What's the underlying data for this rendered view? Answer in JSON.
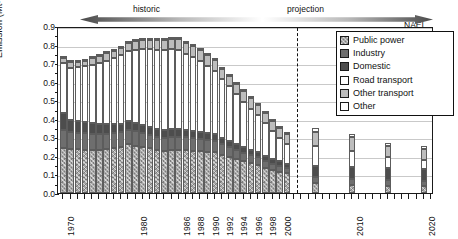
{
  "chart_data": {
    "type": "bar",
    "subtype": "stacked-bar",
    "title": "",
    "xlabel": "",
    "ylabel": "Emission (Mt-N)",
    "ylim": [
      0.0,
      0.9
    ],
    "yticks": [
      "0.0",
      "0.1",
      "0.2",
      "0.3",
      "0.4",
      "0.5",
      "0.6",
      "0.7",
      "0.8",
      "0.9"
    ],
    "grid": "horizontal",
    "legend_position": "top-right",
    "series_order": [
      "Public power",
      "Industry",
      "Domestic",
      "Road transport",
      "Other transport",
      "Other"
    ],
    "series": [
      {
        "name": "Public power",
        "values": [
          0.24,
          0.238,
          0.236,
          0.234,
          0.232,
          0.234,
          0.238,
          0.242,
          0.248,
          0.262,
          0.255,
          0.248,
          0.24,
          0.232,
          0.228,
          0.23,
          0.232,
          0.23,
          0.228,
          0.224,
          0.222,
          0.22,
          0.205,
          0.196,
          0.183,
          0.17,
          0.16,
          0.152,
          0.137,
          0.124,
          0.115,
          0.106,
          0.052,
          0.045,
          0.04,
          0.038
        ]
      },
      {
        "name": "Industry",
        "values": [
          0.098,
          0.092,
          0.09,
          0.088,
          0.086,
          0.084,
          0.082,
          0.08,
          0.08,
          0.08,
          0.078,
          0.074,
          0.072,
          0.07,
          0.07,
          0.072,
          0.072,
          0.07,
          0.068,
          0.066,
          0.064,
          0.062,
          0.057,
          0.054,
          0.05,
          0.046,
          0.043,
          0.041,
          0.037,
          0.034,
          0.032,
          0.03,
          0.036,
          0.032,
          0.03,
          0.028
        ]
      },
      {
        "name": "Domestic",
        "values": [
          0.092,
          0.064,
          0.062,
          0.06,
          0.058,
          0.054,
          0.052,
          0.05,
          0.046,
          0.046,
          0.044,
          0.042,
          0.042,
          0.042,
          0.042,
          0.042,
          0.042,
          0.04,
          0.04,
          0.04,
          0.038,
          0.036,
          0.033,
          0.032,
          0.031,
          0.03,
          0.029,
          0.028,
          0.026,
          0.025,
          0.024,
          0.023,
          0.058,
          0.064,
          0.064,
          0.062
        ]
      },
      {
        "name": "Road transport",
        "values": [
          0.272,
          0.282,
          0.29,
          0.3,
          0.316,
          0.33,
          0.342,
          0.354,
          0.368,
          0.378,
          0.396,
          0.412,
          0.42,
          0.428,
          0.43,
          0.432,
          0.424,
          0.41,
          0.396,
          0.382,
          0.362,
          0.34,
          0.318,
          0.294,
          0.27,
          0.246,
          0.222,
          0.2,
          0.176,
          0.15,
          0.126,
          0.104,
          0.11,
          0.086,
          0.06,
          0.048
        ]
      },
      {
        "name": "Other transport",
        "values": [
          0.024,
          0.028,
          0.03,
          0.032,
          0.034,
          0.036,
          0.038,
          0.04,
          0.042,
          0.044,
          0.046,
          0.048,
          0.05,
          0.052,
          0.054,
          0.056,
          0.058,
          0.058,
          0.058,
          0.058,
          0.058,
          0.058,
          0.056,
          0.056,
          0.056,
          0.056,
          0.056,
          0.056,
          0.056,
          0.056,
          0.056,
          0.056,
          0.074,
          0.074,
          0.062,
          0.062
        ]
      },
      {
        "name": "Other",
        "values": [
          0.008,
          0.008,
          0.008,
          0.008,
          0.008,
          0.008,
          0.008,
          0.008,
          0.008,
          0.008,
          0.008,
          0.008,
          0.008,
          0.008,
          0.008,
          0.008,
          0.008,
          0.008,
          0.008,
          0.008,
          0.008,
          0.008,
          0.008,
          0.008,
          0.008,
          0.008,
          0.008,
          0.008,
          0.008,
          0.008,
          0.008,
          0.008,
          0.018,
          0.018,
          0.016,
          0.016
        ]
      }
    ],
    "x": [
      1970,
      1971,
      1972,
      1973,
      1974,
      1975,
      1976,
      1977,
      1978,
      1979,
      1980,
      1981,
      1982,
      1983,
      1984,
      1985,
      1986,
      1987,
      1988,
      1989,
      1990,
      1991,
      1992,
      1993,
      1994,
      1995,
      1996,
      1997,
      1998,
      1999,
      2000,
      2001,
      2005,
      2010,
      2015,
      2020
    ],
    "totals": [
      0.734,
      0.712,
      0.716,
      0.722,
      0.734,
      0.746,
      0.76,
      0.774,
      0.792,
      0.818,
      0.827,
      0.832,
      0.832,
      0.832,
      0.832,
      0.84,
      0.836,
      0.816,
      0.798,
      0.778,
      0.752,
      0.724,
      0.677,
      0.64,
      0.598,
      0.556,
      0.518,
      0.485,
      0.44,
      0.397,
      0.361,
      0.327,
      0.348,
      0.319,
      0.272,
      0.254
    ],
    "xtick_labels": [
      "1970",
      "1980",
      "1986",
      "1988",
      "1990",
      "1992",
      "1994",
      "1996",
      "1998",
      "2000",
      "2010",
      "2020"
    ],
    "annotations": [
      {
        "text": "historic",
        "kind": "period-label"
      },
      {
        "text": "projection",
        "kind": "period-label"
      },
      {
        "text": "NAEI",
        "kind": "source-label"
      }
    ],
    "colors": {
      "public_power": "#a8a8a8",
      "industry": "#6e6e6e",
      "domestic": "#4d4d4d",
      "road_transport": "#ffffff",
      "other_transport": "#bdbdbd",
      "other": "#ffffff",
      "axis": "#1a1a1a",
      "grid": "#c9c9c9"
    }
  },
  "axis": {
    "y_title": "Emission (Mt-N)",
    "y_labels": [
      "0.9",
      "0.8",
      "0.7",
      "0.6",
      "0.5",
      "0.4",
      "0.3",
      "0.2",
      "0.1",
      "0.0"
    ],
    "x_labels": [
      "1970",
      "1980",
      "1986",
      "1988",
      "1990",
      "1992",
      "1994",
      "1996",
      "1998",
      "2000",
      "2010",
      "2020"
    ]
  },
  "annotations": {
    "historic": "historic",
    "projection": "projection",
    "naei": "NAEI"
  },
  "legend": {
    "items": [
      {
        "label": "Public power",
        "fill": "f-public"
      },
      {
        "label": "Industry",
        "fill": "f-industry"
      },
      {
        "label": "Domestic",
        "fill": "f-domestic"
      },
      {
        "label": "Road transport",
        "fill": "f-road"
      },
      {
        "label": "Other transport",
        "fill": "f-othertr"
      },
      {
        "label": "Other",
        "fill": "f-other"
      }
    ]
  }
}
